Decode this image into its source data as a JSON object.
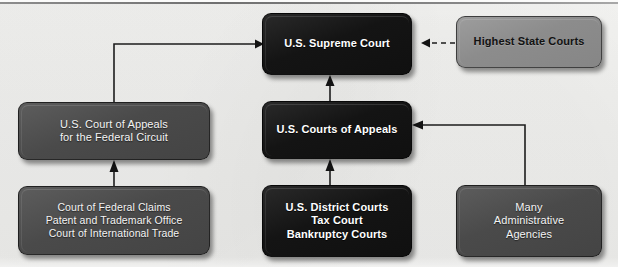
{
  "diagram": {
    "background_color": "#eeeeec",
    "palette": {
      "black_box": "#141414",
      "dark_gray_box": "#4a4a4a",
      "light_gray_box": "#8c8c8c",
      "connector": "#1d1d1d",
      "white_text": "#ffffff",
      "dark_text": "#121212"
    },
    "nodes": [
      {
        "id": "supreme-court",
        "style": "black",
        "lines": [
          "U.S. Supreme Court"
        ],
        "x": 262,
        "y": 13,
        "w": 150,
        "h": 62,
        "font_size": 11
      },
      {
        "id": "highest-state-courts",
        "style": "lightgray",
        "lines": [
          "Highest State Courts"
        ],
        "x": 456,
        "y": 16,
        "w": 146,
        "h": 52,
        "font_size": 11
      },
      {
        "id": "federal-circuit",
        "style": "darkgray",
        "lines": [
          "U.S. Court of Appeals",
          "for the Federal Circuit"
        ],
        "x": 18,
        "y": 102,
        "w": 192,
        "h": 58,
        "font_size": 11
      },
      {
        "id": "courts-of-appeals",
        "style": "black",
        "lines": [
          "U.S. Courts of Appeals"
        ],
        "x": 262,
        "y": 101,
        "w": 150,
        "h": 58,
        "font_size": 11
      },
      {
        "id": "specialized-courts",
        "style": "darkgray",
        "lines": [
          "Court of Federal Claims",
          "Patent and Trademark Office",
          "Court of International Trade"
        ],
        "x": 18,
        "y": 186,
        "w": 192,
        "h": 69,
        "font_size": 10.5
      },
      {
        "id": "district-courts",
        "style": "black",
        "lines": [
          "U.S. District Courts",
          "Tax Court",
          "Bankruptcy Courts"
        ],
        "x": 262,
        "y": 185,
        "w": 150,
        "h": 72,
        "font_size": 11
      },
      {
        "id": "administrative-agencies",
        "style": "darkgray",
        "lines": [
          "Many",
          "Administrative",
          "Agencies"
        ],
        "x": 456,
        "y": 185,
        "w": 146,
        "h": 72,
        "font_size": 11
      }
    ],
    "edges": [
      {
        "id": "federal-circuit-to-supreme-court",
        "from": "federal-circuit",
        "to": "supreme-court",
        "style": "solid",
        "arrow": "right"
      },
      {
        "id": "highest-state-courts-to-supreme-court",
        "from": "highest-state-courts",
        "to": "supreme-court",
        "style": "dashed",
        "arrow": "left"
      },
      {
        "id": "courts-of-appeals-to-supreme-court",
        "from": "courts-of-appeals",
        "to": "supreme-court",
        "style": "solid",
        "arrow": "up"
      },
      {
        "id": "district-courts-to-courts-of-appeals",
        "from": "district-courts",
        "to": "courts-of-appeals",
        "style": "solid",
        "arrow": "up"
      },
      {
        "id": "specialized-courts-to-federal-circuit",
        "from": "specialized-courts",
        "to": "federal-circuit",
        "style": "solid",
        "arrow": "up"
      },
      {
        "id": "administrative-agencies-to-courts-of-appeals",
        "from": "administrative-agencies",
        "to": "courts-of-appeals",
        "style": "solid",
        "arrow": "left"
      }
    ]
  }
}
